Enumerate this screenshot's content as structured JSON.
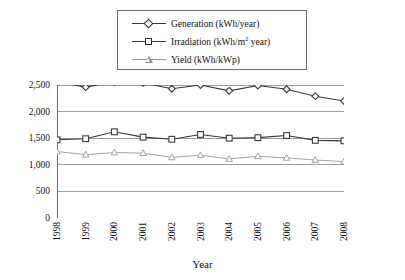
{
  "chart_data": {
    "type": "line",
    "title": "",
    "xlabel": "Year",
    "ylabel": "",
    "categories": [
      "1998",
      "1999",
      "2000",
      "2001",
      "2002",
      "2003",
      "2004",
      "2005",
      "2006",
      "2007",
      "2008"
    ],
    "ylim": [
      0,
      2500
    ],
    "yticks": [
      0,
      500,
      1000,
      1500,
      2000,
      2500
    ],
    "ytick_labels": [
      "0",
      "500",
      "1,000",
      "1,500",
      "2,000",
      "2,500"
    ],
    "grid": true,
    "legend_position": "top-center",
    "series": [
      {
        "name": "Generation (kWh/year)",
        "marker": "diamond",
        "color": "#3a3a3a",
        "values": [
          2560,
          2460,
          2560,
          2540,
          2430,
          2500,
          2390,
          2490,
          2420,
          2290,
          2200
        ]
      },
      {
        "name": "Irradiation (kWh/m² year)",
        "marker": "square",
        "color": "#3a3a3a",
        "values": [
          1470,
          1490,
          1620,
          1520,
          1480,
          1570,
          1500,
          1510,
          1550,
          1460,
          1450
        ]
      },
      {
        "name": "Yield (kWh/kWp)",
        "marker": "triangle",
        "color": "#9a9a9a",
        "values": [
          1250,
          1190,
          1230,
          1220,
          1140,
          1180,
          1110,
          1160,
          1130,
          1090,
          1060
        ]
      }
    ]
  },
  "legend": {
    "items": [
      {
        "label_main": "Generation (kWh/year)",
        "label_pre": "Generation (kWh/year)",
        "sup": "",
        "label_post": ""
      },
      {
        "label_main": "Irradiation (kWh/m² year)",
        "label_pre": "Irradiation (kWh/m",
        "sup": "2",
        "label_post": " year)"
      },
      {
        "label_main": "Yield (kWh/kWp)",
        "label_pre": "Yield (kWh/kWp)",
        "sup": "",
        "label_post": ""
      }
    ]
  },
  "axis": {
    "x_title": "Year"
  },
  "colors": {
    "generation": "#3a3a3a",
    "irradiation": "#3a3a3a",
    "yield": "#9a9a9a",
    "grid": "#9d9d9d",
    "axis": "#6e6e6e"
  }
}
